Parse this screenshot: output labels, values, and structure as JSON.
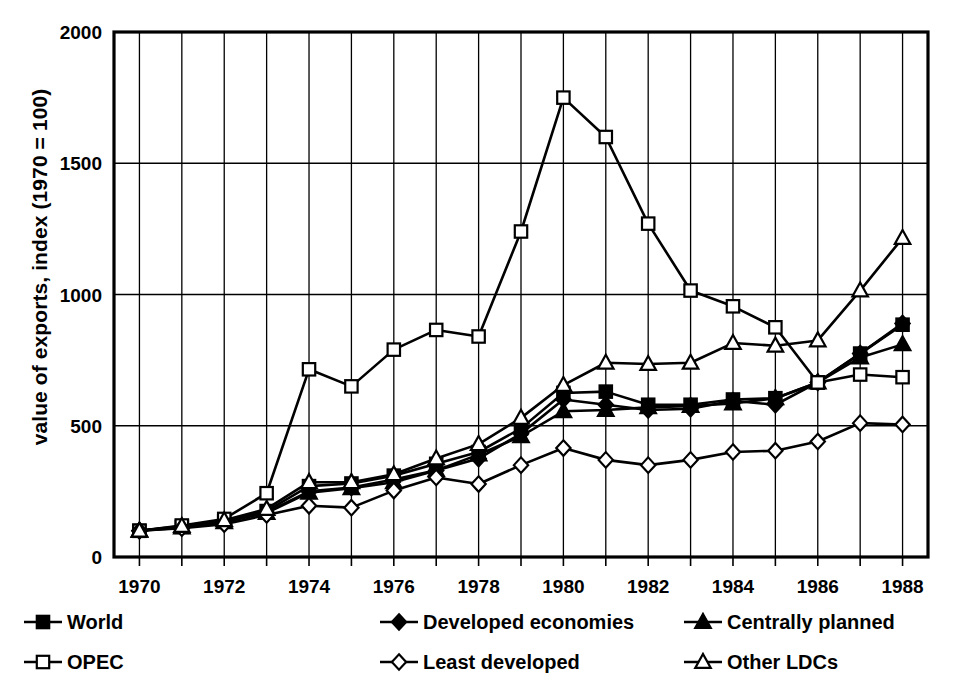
{
  "axis": {
    "ylabel": "value of exports, index (1970 = 100)",
    "yticks": [
      "0",
      "500",
      "1000",
      "1500",
      "2000"
    ],
    "xticks": [
      "1970",
      "1972",
      "1974",
      "1976",
      "1978",
      "1980",
      "1982",
      "1984",
      "1986",
      "1988"
    ]
  },
  "legend": {
    "items": [
      {
        "label": "World",
        "marker": "filled-square",
        "key": "world"
      },
      {
        "label": "Developed economies",
        "marker": "filled-diamond",
        "key": "developed"
      },
      {
        "label": "Centrally planned",
        "marker": "filled-triangle",
        "key": "centrally_planned"
      },
      {
        "label": "OPEC",
        "marker": "open-square",
        "key": "opec"
      },
      {
        "label": "Least developed",
        "marker": "open-diamond",
        "key": "least_developed"
      },
      {
        "label": "Other LDCs",
        "marker": "open-triangle",
        "key": "other_ldcs"
      }
    ]
  },
  "chart_data": {
    "type": "line",
    "title": "",
    "xlabel": "",
    "ylabel": "value of exports, index (1970 = 100)",
    "xlim": [
      1969.4,
      1988.6
    ],
    "ylim": [
      0,
      2000
    ],
    "yticks": [
      0,
      500,
      1000,
      1500,
      2000
    ],
    "xticks": [
      1970,
      1972,
      1974,
      1976,
      1978,
      1980,
      1982,
      1984,
      1986,
      1988
    ],
    "grid": true,
    "grid_x_every": 1,
    "legend_position": "below",
    "x": [
      1970,
      1971,
      1972,
      1973,
      1974,
      1975,
      1976,
      1977,
      1978,
      1979,
      1980,
      1981,
      1982,
      1983,
      1984,
      1985,
      1986,
      1987,
      1988
    ],
    "series": [
      {
        "name": "World",
        "marker": "filled-square",
        "values": [
          100,
          115,
          135,
          175,
          270,
          280,
          310,
          355,
          400,
          490,
          625,
          630,
          580,
          580,
          600,
          605,
          665,
          775,
          885
        ]
      },
      {
        "name": "Developed economies",
        "marker": "filled-diamond",
        "values": [
          100,
          115,
          135,
          170,
          250,
          265,
          295,
          330,
          375,
          470,
          600,
          580,
          560,
          565,
          595,
          580,
          665,
          775,
          890
        ]
      },
      {
        "name": "Centrally planned",
        "marker": "filled-triangle",
        "values": [
          100,
          112,
          132,
          168,
          245,
          262,
          285,
          330,
          390,
          460,
          555,
          560,
          570,
          575,
          585,
          605,
          665,
          760,
          810
        ]
      },
      {
        "name": "OPEC",
        "marker": "open-square",
        "values": [
          100,
          120,
          145,
          243,
          715,
          650,
          790,
          865,
          840,
          1240,
          1750,
          1600,
          1270,
          1015,
          955,
          875,
          665,
          695,
          685
        ]
      },
      {
        "name": "Least developed",
        "marker": "open-diamond",
        "values": [
          100,
          110,
          125,
          160,
          195,
          188,
          253,
          303,
          278,
          350,
          415,
          370,
          350,
          370,
          400,
          405,
          440,
          510,
          505
        ]
      },
      {
        "name": "Other LDCs",
        "marker": "open-triangle",
        "values": [
          100,
          118,
          140,
          183,
          285,
          285,
          315,
          375,
          430,
          530,
          655,
          740,
          735,
          740,
          815,
          805,
          825,
          1015,
          1215
        ]
      }
    ]
  }
}
